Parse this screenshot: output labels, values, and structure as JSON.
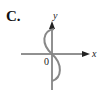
{
  "option_label": "C.",
  "axes": {
    "x_label": "x",
    "y_label": "y",
    "origin_label": "0"
  },
  "curve": {
    "description": "S-shaped curve through origin, bulging left above x-axis and right below",
    "color": "#888888"
  },
  "colors": {
    "axis": "#222222",
    "curve": "#888888"
  }
}
